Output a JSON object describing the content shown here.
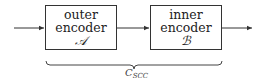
{
  "diagram": {
    "blocks": [
      {
        "line1": "outer",
        "line2": "encoder",
        "symbol": "𝒜"
      },
      {
        "line1": "inner",
        "line2": "encoder",
        "symbol": "ℬ"
      }
    ],
    "brace_label": {
      "main": "C",
      "sub": "SCC"
    },
    "colors": {
      "stroke": "#333333",
      "background": "#ffffff"
    }
  }
}
